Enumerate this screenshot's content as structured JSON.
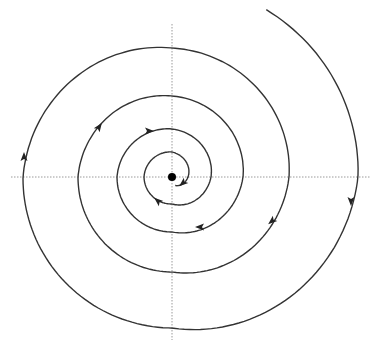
{
  "diagram": {
    "type": "phase-portrait-stable-spiral",
    "flow_direction": "clockwise-inward",
    "center": {
      "x": 172,
      "y": 177,
      "dot_radius": 4
    },
    "axes": {
      "horizontal": {
        "y": 177,
        "x1": 11,
        "x2": 370
      },
      "vertical": {
        "x": 172,
        "y1": 24,
        "y2": 340
      },
      "color": "#9a9a9a",
      "style": "dotted"
    },
    "spiral": {
      "color": "#333333",
      "start_angle_deg": -60.6,
      "radii_every_90deg_clockwise": [
        192,
        186,
        151,
        149,
        129,
        117,
        95,
        94,
        81,
        71,
        55,
        55,
        48,
        39,
        27,
        28,
        25,
        16,
        9
      ],
      "radii_start_angles_deg": [
        -60.6,
        0,
        90,
        180,
        270,
        360,
        450,
        540,
        630,
        720,
        810,
        900,
        990,
        1080,
        1170,
        1260,
        1350,
        1440,
        1510
      ]
    },
    "arrows": [
      {
        "x": 351,
        "y": 201,
        "direction": "down"
      },
      {
        "x": 24,
        "y": 157,
        "direction": "up"
      },
      {
        "x": 99,
        "y": 127,
        "direction": "up-right"
      },
      {
        "x": 272,
        "y": 221,
        "direction": "down-left"
      },
      {
        "x": 200,
        "y": 227,
        "direction": "left"
      },
      {
        "x": 149,
        "y": 131,
        "direction": "right"
      },
      {
        "x": 158,
        "y": 201,
        "direction": "up-left"
      },
      {
        "x": 183,
        "y": 183,
        "direction": "down-left"
      }
    ]
  }
}
